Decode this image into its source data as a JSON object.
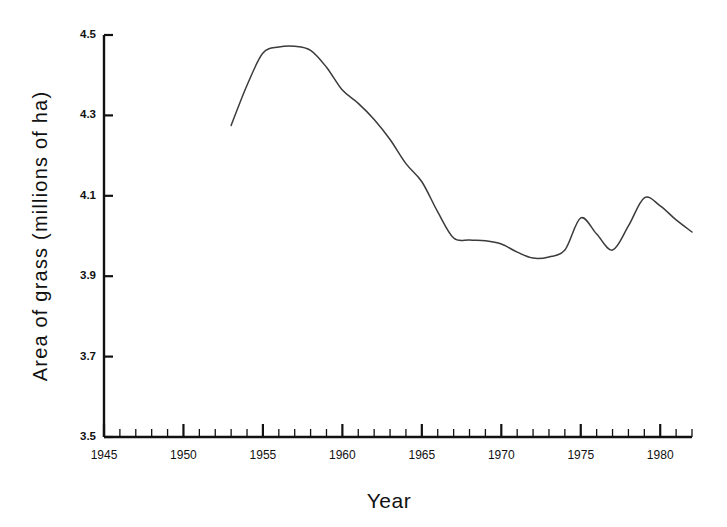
{
  "chart_data": {
    "type": "line",
    "title": "",
    "subtitle": "",
    "xlabel": "Year",
    "ylabel": "Area of grass (millions of ha)",
    "xlim": [
      1945,
      1982
    ],
    "ylim": [
      3.5,
      4.5
    ],
    "grid": false,
    "legend": null,
    "legend_position": "none",
    "x_major_ticks": [
      1945,
      1950,
      1955,
      1960,
      1965,
      1970,
      1975,
      1980
    ],
    "x_major_tick_labels": [
      "1945",
      "1950",
      "1955",
      "1960",
      "1965",
      "1970",
      "1975",
      "1980"
    ],
    "x_minor_tick_interval": 1,
    "y_major_ticks": [
      3.5,
      3.7,
      3.9,
      4.1,
      4.3,
      4.5
    ],
    "y_major_tick_labels": [
      "3.5",
      "3.7",
      "3.9",
      "4.1",
      "4.3",
      "4.5"
    ],
    "series": [
      {
        "name": "Area of grass",
        "color": "#3b3b3b",
        "x": [
          1953,
          1954,
          1955,
          1956,
          1957,
          1958,
          1959,
          1960,
          1961,
          1962,
          1963,
          1964,
          1965,
          1966,
          1967,
          1968,
          1969,
          1970,
          1971,
          1972,
          1973,
          1974,
          1975,
          1976,
          1977,
          1978,
          1979,
          1980,
          1981,
          1982
        ],
        "y": [
          4.275,
          4.375,
          4.455,
          4.47,
          4.472,
          4.462,
          4.42,
          4.363,
          4.33,
          4.29,
          4.24,
          4.18,
          4.135,
          4.06,
          3.995,
          3.99,
          3.988,
          3.98,
          3.96,
          3.945,
          3.948,
          3.965,
          4.045,
          4.005,
          3.965,
          4.025,
          4.095,
          4.075,
          4.04,
          4.01
        ]
      }
    ],
    "annotations": []
  },
  "axis": {
    "y_axis_name": "y-axis",
    "x_axis_name": "x-axis"
  }
}
